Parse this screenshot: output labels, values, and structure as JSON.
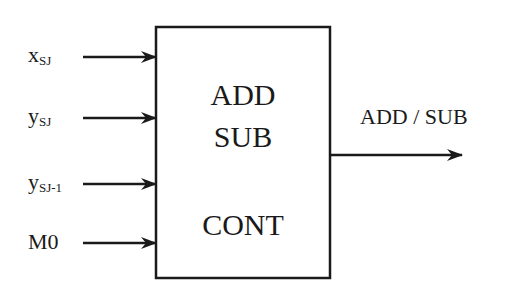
{
  "diagram": {
    "block": {
      "line1": "ADD",
      "line2": "SUB",
      "line3": "CONT"
    },
    "inputs": [
      {
        "base": "x",
        "sub": "SJ"
      },
      {
        "base": "y",
        "sub": "SJ"
      },
      {
        "base": "y",
        "sub": "SJ-1"
      },
      {
        "base": "M0",
        "sub": ""
      }
    ],
    "output": {
      "label": "ADD / SUB"
    },
    "colors": {
      "stroke": "#1a1a1a",
      "background": "#ffffff"
    }
  }
}
